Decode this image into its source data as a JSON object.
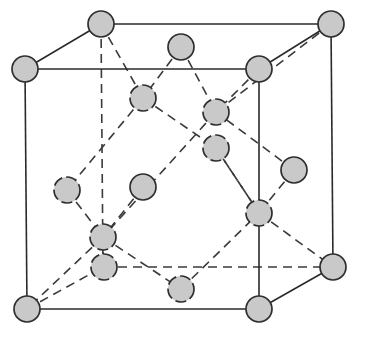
{
  "diagram": {
    "colors": {
      "background": "#ffffff",
      "atom_fill": "#c9c9c9",
      "atom_stroke": "#2e2e2e",
      "line": "#2a2a2a"
    },
    "atom_radius": 13,
    "atoms": [
      {
        "id": "corner-front-top-left",
        "x": 25,
        "y": 69,
        "hidden": false
      },
      {
        "id": "corner-back-top-left",
        "x": 101,
        "y": 24,
        "hidden": false
      },
      {
        "id": "corner-back-top-right",
        "x": 331,
        "y": 24,
        "hidden": false
      },
      {
        "id": "corner-front-top-right",
        "x": 259,
        "y": 69,
        "hidden": false
      },
      {
        "id": "corner-front-bottom-left",
        "x": 27,
        "y": 309,
        "hidden": false
      },
      {
        "id": "corner-front-bottom-right",
        "x": 259,
        "y": 309,
        "hidden": false
      },
      {
        "id": "corner-back-bottom-right",
        "x": 333,
        "y": 267,
        "hidden": false
      },
      {
        "id": "face-top",
        "x": 181,
        "y": 47,
        "hidden": false
      },
      {
        "id": "interior-a",
        "x": 143,
        "y": 98,
        "hidden": true
      },
      {
        "id": "interior-b",
        "x": 216,
        "y": 112,
        "hidden": true
      },
      {
        "id": "interior-c",
        "x": 216,
        "y": 148,
        "hidden": true
      },
      {
        "id": "face-right",
        "x": 294,
        "y": 170,
        "hidden": false
      },
      {
        "id": "face-front",
        "x": 143,
        "y": 187,
        "hidden": false
      },
      {
        "id": "interior-d",
        "x": 259,
        "y": 213,
        "hidden": true
      },
      {
        "id": "face-left",
        "x": 67,
        "y": 190,
        "hidden": true
      },
      {
        "id": "interior-e",
        "x": 103,
        "y": 237,
        "hidden": true
      },
      {
        "id": "face-back-bottom",
        "x": 104,
        "y": 267,
        "hidden": true
      },
      {
        "id": "face-bottom",
        "x": 181,
        "y": 289,
        "hidden": true
      }
    ],
    "solid_edges": [
      [
        25,
        69,
        259,
        69
      ],
      [
        259,
        69,
        259,
        309
      ],
      [
        259,
        309,
        27,
        309
      ],
      [
        27,
        309,
        25,
        69
      ],
      [
        101,
        24,
        331,
        24
      ],
      [
        331,
        24,
        333,
        267
      ],
      [
        25,
        69,
        101,
        24
      ],
      [
        259,
        69,
        331,
        24
      ],
      [
        259,
        309,
        333,
        267
      ]
    ],
    "dashed_edges": [
      [
        101,
        24,
        103,
        267
      ],
      [
        103,
        267,
        333,
        267
      ],
      [
        27,
        309,
        103,
        267
      ],
      [
        101,
        24,
        143,
        98
      ],
      [
        181,
        47,
        143,
        98
      ],
      [
        181,
        47,
        216,
        112
      ],
      [
        331,
        24,
        216,
        112
      ],
      [
        143,
        98,
        216,
        148
      ],
      [
        143,
        98,
        67,
        190
      ],
      [
        216,
        112,
        103,
        237
      ],
      [
        259,
        69,
        216,
        112
      ],
      [
        216,
        148,
        259,
        213
      ],
      [
        294,
        170,
        216,
        112
      ],
      [
        294,
        170,
        259,
        213
      ],
      [
        67,
        190,
        103,
        237
      ],
      [
        143,
        187,
        103,
        237
      ],
      [
        103,
        237,
        103,
        267
      ],
      [
        103,
        237,
        27,
        309
      ],
      [
        103,
        237,
        181,
        289
      ],
      [
        181,
        289,
        259,
        213
      ],
      [
        259,
        213,
        333,
        267
      ],
      [
        259,
        213,
        216,
        148
      ]
    ]
  }
}
